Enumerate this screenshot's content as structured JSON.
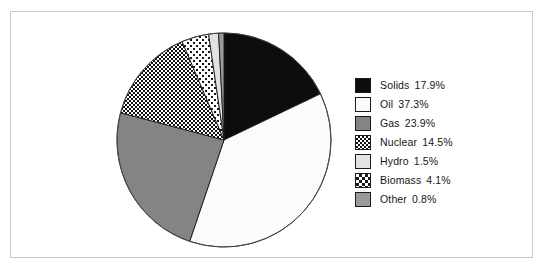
{
  "chart_data": {
    "type": "pie",
    "title": "",
    "subtitle": "",
    "xlabel": "",
    "ylabel": "",
    "legend_position": "right",
    "grid": false,
    "start_angle_deg": 0,
    "direction": "clockwise",
    "categories": [
      "Solids",
      "Oil",
      "Gas",
      "Nuclear",
      "Hydro",
      "Biomass",
      "Other"
    ],
    "values": [
      17.9,
      37.3,
      23.9,
      14.5,
      1.5,
      4.1,
      0.8
    ],
    "value_suffix": "%",
    "slice_draw_order": [
      "Solids",
      "Oil",
      "Gas",
      "Nuclear",
      "Biomass",
      "Hydro",
      "Other"
    ],
    "slices": [
      {
        "label": "Solids",
        "value": 17.9,
        "value_label": "17.9%",
        "fill": "#0d0d0d",
        "pattern": "solid"
      },
      {
        "label": "Oil",
        "value": 37.3,
        "value_label": "37.3%",
        "fill": "#fbfbfb",
        "pattern": "solid"
      },
      {
        "label": "Gas",
        "value": 23.9,
        "value_label": "23.9%",
        "fill": "#848484",
        "pattern": "solid"
      },
      {
        "label": "Nuclear",
        "value": 14.5,
        "value_label": "14.5%",
        "fill": "#ffffff",
        "pattern": "checker-dense"
      },
      {
        "label": "Hydro",
        "value": 1.5,
        "value_label": "1.5%",
        "fill": "#e2e2e2",
        "pattern": "solid"
      },
      {
        "label": "Biomass",
        "value": 4.1,
        "value_label": "4.1%",
        "fill": "#ffffff",
        "pattern": "dots-sparse"
      },
      {
        "label": "Other",
        "value": 0.8,
        "value_label": "0.8%",
        "fill": "#9a9a9a",
        "pattern": "solid"
      }
    ]
  },
  "legend": {
    "items": [
      {
        "label": "Solids",
        "value_label": "17.9%"
      },
      {
        "label": "Oil",
        "value_label": "37.3%"
      },
      {
        "label": "Gas",
        "value_label": "23.9%"
      },
      {
        "label": "Nuclear",
        "value_label": "14.5%"
      },
      {
        "label": "Hydro",
        "value_label": "1.5%"
      },
      {
        "label": "Biomass",
        "value_label": "4.1%"
      },
      {
        "label": "Other",
        "value_label": "0.8%"
      }
    ]
  },
  "colors": {
    "frame_border": "#c9c9c9",
    "background": "#ffffff",
    "outline": "#1a1a1a",
    "text": "#161616"
  }
}
